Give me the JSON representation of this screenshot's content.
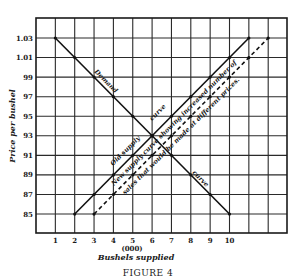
{
  "chart_data": {
    "type": "line",
    "title": "",
    "caption": "FIGURE 4",
    "xlabel": "Bushels supplied",
    "xlabel_unit": "(000)",
    "ylabel": "Price per bushel",
    "x_ticks": [
      "1",
      "2",
      "3",
      "4",
      "5",
      "6",
      "7",
      "8",
      "9",
      "10"
    ],
    "y_ticks": [
      "1.03",
      "1.01",
      "99",
      "97",
      "95",
      "93",
      "91",
      "89",
      "87",
      "85"
    ],
    "y_tick_values": [
      103,
      101,
      99,
      97,
      95,
      93,
      91,
      89,
      87,
      85
    ],
    "xlim": [
      0,
      13
    ],
    "ylim": [
      83,
      105
    ],
    "grid": true,
    "series": [
      {
        "name": "Demand",
        "style": "solid",
        "x": [
          1,
          2,
          3,
          4,
          5,
          6,
          7,
          8,
          9,
          10
        ],
        "y": [
          103,
          101,
          99,
          97,
          95,
          93,
          91,
          89,
          87,
          85
        ]
      },
      {
        "name": "Old supply curve",
        "style": "solid",
        "x": [
          2,
          3,
          4,
          5,
          6,
          7,
          8,
          9,
          10,
          11
        ],
        "y": [
          85,
          87,
          89,
          91,
          93,
          95,
          97,
          99,
          101,
          103
        ]
      },
      {
        "name": "New supply curve showing increased number of sales that would be made at different prices.",
        "style": "dashed",
        "x": [
          3,
          4,
          5,
          6,
          7,
          8,
          9,
          10,
          11,
          12
        ],
        "y": [
          85,
          87,
          89,
          91,
          93,
          95,
          97,
          99,
          101,
          103
        ]
      }
    ],
    "annotations": [
      {
        "text": "Demand",
        "along": "Demand"
      },
      {
        "text": "curve",
        "along": "Demand"
      },
      {
        "text": "Old supply",
        "along": "Old supply curve"
      },
      {
        "text": "curve",
        "along": "Old supply curve"
      },
      {
        "text": "New supply curve showing increased number of",
        "along": "New supply curve"
      },
      {
        "text": "sales that would be made at different prices.",
        "along": "New supply curve"
      }
    ]
  },
  "labels": {
    "demand1": "Demand",
    "demand2": "curve",
    "old1": "Old supply",
    "old2": "curve",
    "new1": "New supply curve showing increased number of",
    "new2": "sales that would be made at different prices."
  }
}
